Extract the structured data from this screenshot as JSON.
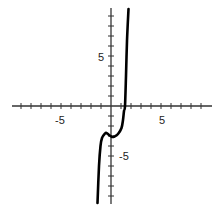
{
  "chart_data": {
    "type": "line",
    "title": "",
    "xlabel": "",
    "ylabel": "",
    "xlim": [
      -10,
      10
    ],
    "ylim": [
      -10,
      10
    ],
    "grid": false,
    "legend": null,
    "x_tick_labels": [
      {
        "value": -5,
        "label": "-5"
      },
      {
        "value": 5,
        "label": "5"
      }
    ],
    "y_tick_labels": [
      {
        "value": 5,
        "label": "5"
      },
      {
        "value": -5,
        "label": "-5"
      }
    ],
    "x_ticks": [
      -9,
      -8,
      -7,
      -6,
      -5,
      -4,
      -3,
      -2,
      -1,
      1,
      2,
      3,
      4,
      5,
      6,
      7,
      8,
      9
    ],
    "y_ticks": [
      -9,
      -8,
      -7,
      -6,
      -5,
      -4,
      -3,
      -2,
      -1,
      1,
      2,
      3,
      4,
      5,
      6,
      7,
      8,
      9
    ],
    "series": [
      {
        "name": "f(x)",
        "description": "Polynomial curve with local max near (-0.5, -2.7) and local min near (0.2, -3.1), crossing x-axis near x = 1.4",
        "points": [
          {
            "x": -1.35,
            "y": -9.7
          },
          {
            "x": -1.2,
            "y": -6.0
          },
          {
            "x": -1.05,
            "y": -4.0
          },
          {
            "x": -0.9,
            "y": -3.2
          },
          {
            "x": -0.6,
            "y": -2.75
          },
          {
            "x": -0.45,
            "y": -2.7
          },
          {
            "x": -0.2,
            "y": -2.9
          },
          {
            "x": 0.1,
            "y": -3.1
          },
          {
            "x": 0.35,
            "y": -3.05
          },
          {
            "x": 0.7,
            "y": -2.8
          },
          {
            "x": 1.05,
            "y": -2.2
          },
          {
            "x": 1.2,
            "y": -1.4
          },
          {
            "x": 1.3,
            "y": -0.5
          },
          {
            "x": 1.4,
            "y": 0.0
          },
          {
            "x": 1.5,
            "y": 3.0
          },
          {
            "x": 1.6,
            "y": 6.5
          },
          {
            "x": 1.75,
            "y": 9.7
          }
        ]
      }
    ]
  },
  "labels": {
    "x_neg5": "-5",
    "x_pos5": "5",
    "y_pos5": "5",
    "y_neg5": "-5"
  },
  "colors": {
    "axis": "#333333",
    "curve": "#000000"
  }
}
